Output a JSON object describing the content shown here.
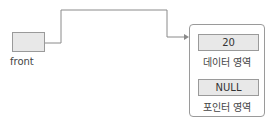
{
  "pointer": {
    "label": "front"
  },
  "node": {
    "data_value": "20",
    "data_caption": "데이터 영역",
    "link_value": "NULL",
    "link_caption": "포인터 영역"
  },
  "colors": {
    "box_fill": "#e8e8e8",
    "stroke": "#9a9a9a",
    "line": "#8a8a8a"
  }
}
